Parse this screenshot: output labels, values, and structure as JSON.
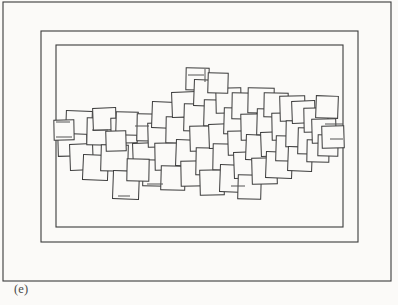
{
  "figure": {
    "caption": "(e)",
    "kind": "line-drawing",
    "colors": {
      "background": "#fbfaf8",
      "ink": "#3b3b3b",
      "ink_light": "#555555"
    },
    "frames": [
      {
        "name": "outer-frame",
        "x": 3,
        "y": 2,
        "width": 388,
        "height": 279,
        "stroke_width": 1.1
      },
      {
        "name": "middle-frame",
        "x": 41,
        "y": 31,
        "width": 317,
        "height": 211,
        "stroke_width": 1.1
      },
      {
        "name": "inner-frame",
        "x": 56,
        "y": 45,
        "width": 287,
        "height": 182,
        "stroke_width": 1.1
      }
    ],
    "tiling": {
      "name": "pinwheel-square-tiling",
      "square_count": 62,
      "stroke_width": 1.0,
      "squares": [
        {
          "x": 58,
          "y": 129,
          "w": 29,
          "h": 27,
          "r": -1.5
        },
        {
          "x": 66,
          "y": 111,
          "w": 26,
          "h": 23,
          "r": 2.0
        },
        {
          "x": 70,
          "y": 144,
          "w": 23,
          "h": 26,
          "r": -2.0
        },
        {
          "x": 87,
          "y": 118,
          "w": 27,
          "h": 27,
          "r": 1.0
        },
        {
          "x": 83,
          "y": 155,
          "w": 25,
          "h": 25,
          "r": 2.5
        },
        {
          "x": 93,
          "y": 108,
          "w": 23,
          "h": 22,
          "r": -2.0
        },
        {
          "x": 101,
          "y": 145,
          "w": 27,
          "h": 26,
          "r": 1.5
        },
        {
          "x": 111,
          "y": 118,
          "w": 26,
          "h": 25,
          "r": -1.0
        },
        {
          "x": 113,
          "y": 171,
          "w": 26,
          "h": 28,
          "r": 2.0
        },
        {
          "x": 116,
          "y": 112,
          "w": 22,
          "h": 23,
          "r": 1.5
        },
        {
          "x": 133,
          "y": 143,
          "w": 26,
          "h": 26,
          "r": -2.0
        },
        {
          "x": 137,
          "y": 114,
          "w": 27,
          "h": 27,
          "r": 1.0
        },
        {
          "x": 143,
          "y": 160,
          "w": 25,
          "h": 26,
          "r": 1.5
        },
        {
          "x": 148,
          "y": 123,
          "w": 24,
          "h": 24,
          "r": -1.5
        },
        {
          "x": 152,
          "y": 102,
          "w": 24,
          "h": 26,
          "r": 2.0
        },
        {
          "x": 155,
          "y": 143,
          "w": 26,
          "h": 27,
          "r": -1.0
        },
        {
          "x": 161,
          "y": 166,
          "w": 24,
          "h": 24,
          "r": 1.5
        },
        {
          "x": 166,
          "y": 117,
          "w": 27,
          "h": 26,
          "r": 1.0
        },
        {
          "x": 172,
          "y": 92,
          "w": 25,
          "h": 25,
          "r": -2.0
        },
        {
          "x": 176,
          "y": 140,
          "w": 25,
          "h": 26,
          "r": 2.0
        },
        {
          "x": 181,
          "y": 161,
          "w": 26,
          "h": 25,
          "r": -1.0
        },
        {
          "x": 184,
          "y": 104,
          "w": 26,
          "h": 27,
          "r": 1.5
        },
        {
          "x": 186,
          "y": 68,
          "w": 23,
          "h": 22,
          "r": 1.0
        },
        {
          "x": 190,
          "y": 126,
          "w": 25,
          "h": 25,
          "r": -1.5
        },
        {
          "x": 194,
          "y": 80,
          "w": 26,
          "h": 26,
          "r": 2.0
        },
        {
          "x": 196,
          "y": 148,
          "w": 27,
          "h": 27,
          "r": 1.0
        },
        {
          "x": 200,
          "y": 170,
          "w": 24,
          "h": 25,
          "r": -1.5
        },
        {
          "x": 204,
          "y": 100,
          "w": 26,
          "h": 26,
          "r": 1.5
        },
        {
          "x": 209,
          "y": 124,
          "w": 25,
          "h": 24,
          "r": -2.0
        },
        {
          "x": 213,
          "y": 144,
          "w": 26,
          "h": 26,
          "r": 1.0
        },
        {
          "x": 216,
          "y": 88,
          "w": 25,
          "h": 25,
          "r": -1.0
        },
        {
          "x": 220,
          "y": 165,
          "w": 25,
          "h": 27,
          "r": 2.0
        },
        {
          "x": 224,
          "y": 108,
          "w": 26,
          "h": 26,
          "r": 1.5
        },
        {
          "x": 228,
          "y": 131,
          "w": 24,
          "h": 24,
          "r": -1.5
        },
        {
          "x": 232,
          "y": 93,
          "w": 25,
          "h": 26,
          "r": 1.0
        },
        {
          "x": 234,
          "y": 152,
          "w": 26,
          "h": 26,
          "r": -2.0
        },
        {
          "x": 238,
          "y": 175,
          "w": 23,
          "h": 24,
          "r": 1.5
        },
        {
          "x": 241,
          "y": 114,
          "w": 27,
          "h": 26,
          "r": -1.0
        },
        {
          "x": 246,
          "y": 135,
          "w": 24,
          "h": 25,
          "r": 2.0
        },
        {
          "x": 248,
          "y": 88,
          "w": 26,
          "h": 25,
          "r": 1.0
        },
        {
          "x": 252,
          "y": 158,
          "w": 25,
          "h": 26,
          "r": -1.5
        },
        {
          "x": 257,
          "y": 109,
          "w": 26,
          "h": 26,
          "r": 1.5
        },
        {
          "x": 261,
          "y": 132,
          "w": 25,
          "h": 24,
          "r": -2.0
        },
        {
          "x": 264,
          "y": 93,
          "w": 24,
          "h": 24,
          "r": 1.0
        },
        {
          "x": 266,
          "y": 152,
          "w": 26,
          "h": 26,
          "r": 2.0
        },
        {
          "x": 272,
          "y": 113,
          "w": 27,
          "h": 27,
          "r": -1.0
        },
        {
          "x": 276,
          "y": 136,
          "w": 24,
          "h": 25,
          "r": 1.5
        },
        {
          "x": 280,
          "y": 96,
          "w": 25,
          "h": 25,
          "r": -1.5
        },
        {
          "x": 286,
          "y": 121,
          "w": 26,
          "h": 26,
          "r": 1.0
        },
        {
          "x": 288,
          "y": 147,
          "w": 24,
          "h": 24,
          "r": 2.0
        },
        {
          "x": 292,
          "y": 101,
          "w": 23,
          "h": 22,
          "r": -2.0
        },
        {
          "x": 298,
          "y": 128,
          "w": 25,
          "h": 26,
          "r": 1.5
        },
        {
          "x": 304,
          "y": 108,
          "w": 24,
          "h": 24,
          "r": -1.0
        },
        {
          "x": 307,
          "y": 140,
          "w": 22,
          "h": 22,
          "r": 1.0
        },
        {
          "x": 312,
          "y": 119,
          "w": 24,
          "h": 24,
          "r": -1.5
        },
        {
          "x": 316,
          "y": 96,
          "w": 22,
          "h": 22,
          "r": 2.0
        },
        {
          "x": 318,
          "y": 135,
          "w": 20,
          "h": 21,
          "r": 1.0
        },
        {
          "x": 54,
          "y": 120,
          "w": 20,
          "h": 20,
          "r": -1.0
        },
        {
          "x": 322,
          "y": 126,
          "w": 22,
          "h": 22,
          "r": -1.5
        },
        {
          "x": 127,
          "y": 159,
          "w": 22,
          "h": 22,
          "r": 1.0
        },
        {
          "x": 106,
          "y": 131,
          "w": 20,
          "h": 20,
          "r": -1.5
        },
        {
          "x": 208,
          "y": 73,
          "w": 20,
          "h": 20,
          "r": 1.5
        }
      ],
      "connectors": [
        {
          "x1": 56,
          "y1": 137,
          "x2": 72,
          "y2": 137
        },
        {
          "x1": 56,
          "y1": 122,
          "x2": 70,
          "y2": 122
        },
        {
          "x1": 92,
          "y1": 130,
          "x2": 108,
          "y2": 130
        },
        {
          "x1": 135,
          "y1": 126,
          "x2": 149,
          "y2": 126
        },
        {
          "x1": 188,
          "y1": 75,
          "x2": 204,
          "y2": 75
        },
        {
          "x1": 205,
          "y1": 69,
          "x2": 205,
          "y2": 82
        },
        {
          "x1": 325,
          "y1": 124,
          "x2": 343,
          "y2": 124
        },
        {
          "x1": 330,
          "y1": 139,
          "x2": 343,
          "y2": 139
        },
        {
          "x1": 147,
          "y1": 184,
          "x2": 163,
          "y2": 184
        },
        {
          "x1": 231,
          "y1": 186,
          "x2": 245,
          "y2": 186
        },
        {
          "x1": 118,
          "y1": 196,
          "x2": 130,
          "y2": 196
        }
      ]
    }
  }
}
